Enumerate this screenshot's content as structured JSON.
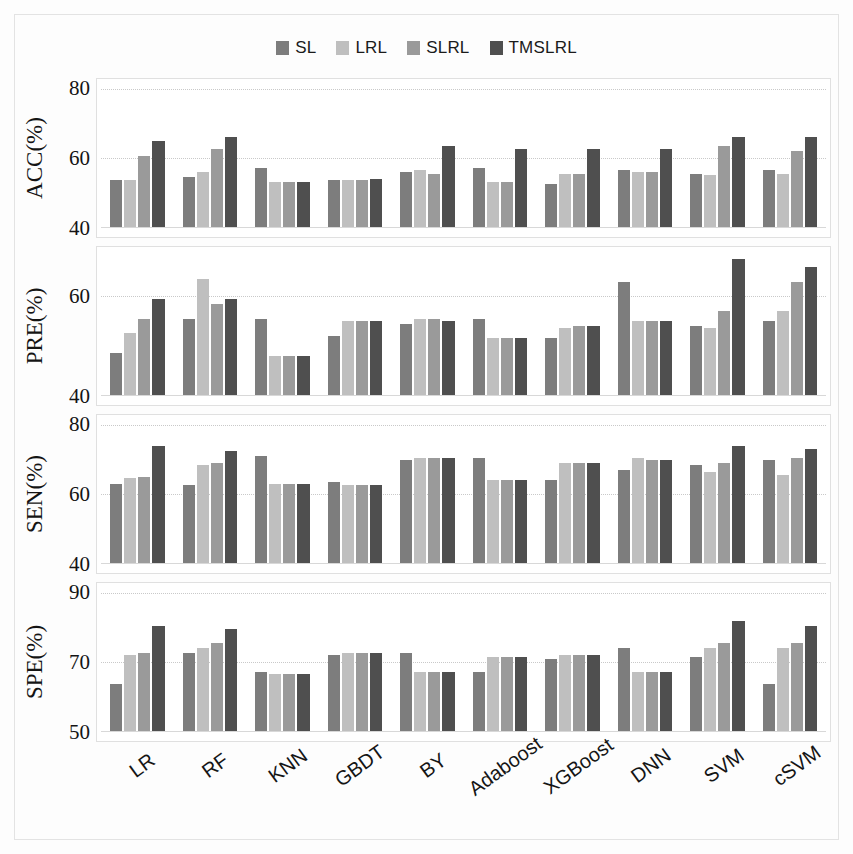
{
  "legend": {
    "position": "top-center",
    "items": [
      {
        "label": "SL",
        "color": "#7d7d7d"
      },
      {
        "label": "LRL",
        "color": "#bfbfbf"
      },
      {
        "label": "SLRL",
        "color": "#9a9a9a"
      },
      {
        "label": "TMSLRL",
        "color": "#4f4f4f"
      }
    ]
  },
  "chart_data": {
    "type": "bar",
    "title": "",
    "xlabel": "",
    "grid": true,
    "categories": [
      "LR",
      "RF",
      "KNN",
      "GBDT",
      "BY",
      "Adaboost",
      "XGBoost",
      "DNN",
      "SVM",
      "cSVM"
    ],
    "series_names": [
      "SL",
      "LRL",
      "SLRL",
      "TMSLRL"
    ],
    "colors": [
      "#7d7d7d",
      "#bfbfbf",
      "#9a9a9a",
      "#4f4f4f"
    ],
    "panels": [
      {
        "ylabel": "ACC(%)",
        "ylim": [
          40,
          80
        ],
        "yticks": [
          40,
          60,
          80
        ],
        "series": [
          {
            "name": "SL",
            "values": [
              53.5,
              54.5,
              57.0,
              53.5,
              56.0,
              57.0,
              52.5,
              56.5,
              55.5,
              56.5
            ]
          },
          {
            "name": "LRL",
            "values": [
              53.5,
              56.0,
              53.0,
              53.5,
              56.5,
              53.0,
              55.5,
              56.0,
              55.0,
              55.5
            ]
          },
          {
            "name": "SLRL",
            "values": [
              60.5,
              62.5,
              53.0,
              53.5,
              55.5,
              53.0,
              55.5,
              56.0,
              63.5,
              62.0
            ]
          },
          {
            "name": "TMSLRL",
            "values": [
              65.0,
              66.0,
              53.0,
              54.0,
              63.5,
              62.5,
              62.5,
              62.5,
              66.0,
              66.0
            ]
          }
        ]
      },
      {
        "ylabel": "PRE(%)",
        "ylim": [
          40,
          68
        ],
        "yticks": [
          40,
          60
        ],
        "series": [
          {
            "name": "SL",
            "values": [
              48.5,
              55.5,
              55.5,
              52.0,
              54.5,
              55.5,
              51.5,
              63.0,
              54.0,
              55.0
            ]
          },
          {
            "name": "LRL",
            "values": [
              52.5,
              63.5,
              48.0,
              55.0,
              55.5,
              51.5,
              53.5,
              55.0,
              53.5,
              57.0
            ]
          },
          {
            "name": "SLRL",
            "values": [
              55.5,
              58.5,
              48.0,
              55.0,
              55.5,
              51.5,
              54.0,
              55.0,
              57.0,
              63.0
            ]
          },
          {
            "name": "TMSLRL",
            "values": [
              59.5,
              59.5,
              48.0,
              55.0,
              55.0,
              51.5,
              54.0,
              55.0,
              67.5,
              66.0
            ]
          }
        ]
      },
      {
        "ylabel": "SEN(%)",
        "ylim": [
          40,
          80
        ],
        "yticks": [
          40,
          60,
          80
        ],
        "series": [
          {
            "name": "SL",
            "values": [
              63.0,
              62.5,
              71.0,
              63.5,
              70.0,
              70.5,
              64.0,
              67.0,
              68.5,
              70.0
            ]
          },
          {
            "name": "LRL",
            "values": [
              64.5,
              68.5,
              63.0,
              62.5,
              70.5,
              64.0,
              69.0,
              70.5,
              66.5,
              65.5
            ]
          },
          {
            "name": "SLRL",
            "values": [
              65.0,
              69.0,
              63.0,
              62.5,
              70.5,
              64.0,
              69.0,
              70.0,
              69.0,
              70.5
            ]
          },
          {
            "name": "TMSLRL",
            "values": [
              74.0,
              72.5,
              63.0,
              62.5,
              70.5,
              64.0,
              69.0,
              70.0,
              74.0,
              73.0
            ]
          }
        ]
      },
      {
        "ylabel": "SPE(%)",
        "ylim": [
          50,
          90
        ],
        "yticks": [
          50,
          70,
          90
        ],
        "series": [
          {
            "name": "SL",
            "values": [
              63.5,
              72.5,
              67.0,
              72.0,
              72.5,
              67.0,
              71.0,
              74.0,
              71.5,
              63.5
            ]
          },
          {
            "name": "LRL",
            "values": [
              72.0,
              74.0,
              66.5,
              72.5,
              67.0,
              71.5,
              72.0,
              67.0,
              74.0,
              74.0
            ]
          },
          {
            "name": "SLRL",
            "values": [
              72.5,
              75.5,
              66.5,
              72.5,
              67.0,
              71.5,
              72.0,
              67.0,
              75.5,
              75.5
            ]
          },
          {
            "name": "TMSLRL",
            "values": [
              80.5,
              79.5,
              66.5,
              72.5,
              67.0,
              71.5,
              72.0,
              67.0,
              82.0,
              80.5
            ]
          }
        ]
      }
    ]
  }
}
